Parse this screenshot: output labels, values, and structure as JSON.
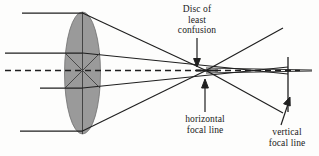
{
  "figure": {
    "background_color": "#fdfdfc",
    "ink_color": "#1a1a1a",
    "lens_fill_color": "#9a9a9a",
    "labels": {
      "disc_of_least_confusion": {
        "line1": "Disc of",
        "line2": "least",
        "line3": "confusion"
      },
      "horizontal_focal_line": {
        "line1": "horizontal",
        "line2": "focal line"
      },
      "vertical_focal_line": {
        "line1": "vertical",
        "line2": "focal line"
      }
    },
    "icons": {
      "lens": "lens-ellipse-icon",
      "optical_axis": "dashed-axis-icon",
      "arrow_down": "arrow-down-icon",
      "arrow_up": "arrow-up-icon",
      "arrow_up_right": "arrow-up-right-icon"
    }
  }
}
